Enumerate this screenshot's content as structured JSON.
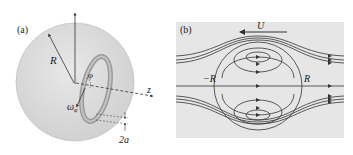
{
  "panel_a": {
    "label": "(a)",
    "radius_label": "R",
    "angle_label": "φ",
    "angular_velocity_label": "ω",
    "angular_velocity_subscript": "φ",
    "axis_label": "z",
    "thickness_label": "2a",
    "colors": {
      "sphere_fill": "#d9d9d9",
      "ring": "#9a9a9a",
      "line": "#333333"
    }
  },
  "panel_b": {
    "label": "(b)",
    "velocity_label": "U",
    "left_label": "−R",
    "right_label": "R",
    "colors": {
      "background": "#e6e6e6",
      "line": "#333333"
    }
  }
}
